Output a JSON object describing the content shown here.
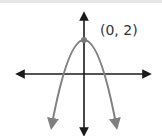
{
  "diagram": {
    "type": "parabola-graph",
    "equation_shape": "downward-opening parabola",
    "vertex": {
      "x": 0,
      "y": 2
    },
    "vertex_label": "(0, 2)",
    "colors": {
      "axes": "#1a1a1a",
      "curve": "#808080",
      "vertex_point": "#7a7a7a",
      "label": "#333333"
    }
  }
}
